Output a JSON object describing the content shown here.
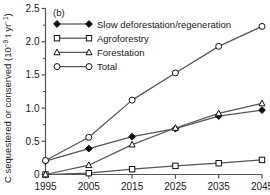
{
  "panel": {
    "label": "(b)"
  },
  "axis": {
    "ylabel_main": "C sequestered or conserved (10",
    "ylabel_sup1": "−9",
    "ylabel_mid": " t yr",
    "ylabel_sup2": "−1",
    "ylabel_end": ")",
    "ylabel_full": "C sequestered or conserved (10−9 t yr−1)",
    "xlabel": ""
  },
  "ticks": {
    "y": [
      "0",
      "0.5",
      "1.0",
      "1.5",
      "2.0",
      "2.5"
    ],
    "x": [
      "1995",
      "2005",
      "2015",
      "2025",
      "2035",
      "2045"
    ]
  },
  "colors": {
    "line": "#555555",
    "marker_stroke": "#111111",
    "marker_fill_open": "#ffffff",
    "marker_fill_solid": "#111111",
    "axis": "#555555",
    "text": "#1a1a1a",
    "background": "#ffffff"
  },
  "chart_data": {
    "type": "line",
    "title": "",
    "subtitle": "",
    "xlabel": "",
    "ylabel": "C sequestered or conserved (10−9 t yr−1)",
    "x": [
      1995,
      2005,
      2015,
      2025,
      2035,
      2045
    ],
    "xlim": [
      1995,
      2045
    ],
    "ylim": [
      0,
      2.5
    ],
    "yticks": [
      0,
      0.5,
      1.0,
      1.5,
      2.0,
      2.5
    ],
    "grid": false,
    "legend_position": "top-left",
    "annotations": [
      "(b)"
    ],
    "series": [
      {
        "name": "Slow deforestation/regeneration",
        "marker": "filled-diamond",
        "values": [
          0.2,
          0.39,
          0.57,
          0.69,
          0.88,
          0.97
        ]
      },
      {
        "name": "Agroforestry",
        "marker": "open-square",
        "values": [
          0.0,
          0.02,
          0.08,
          0.13,
          0.17,
          0.22
        ]
      },
      {
        "name": "Forestation",
        "marker": "open-triangle",
        "values": [
          0.0,
          0.14,
          0.45,
          0.7,
          0.92,
          1.07
        ]
      },
      {
        "name": "Total",
        "marker": "open-circle",
        "values": [
          0.21,
          0.56,
          1.12,
          1.53,
          1.93,
          2.23
        ]
      }
    ]
  },
  "legend": {
    "items": [
      {
        "label": "Slow deforestation/regeneration",
        "marker": "filled-diamond"
      },
      {
        "label": "Agroforestry",
        "marker": "open-square"
      },
      {
        "label": "Forestation",
        "marker": "open-triangle"
      },
      {
        "label": "Total",
        "marker": "open-circle"
      }
    ]
  }
}
